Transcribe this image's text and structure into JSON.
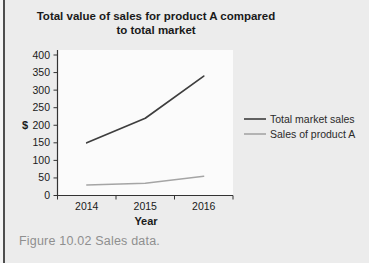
{
  "page": {
    "background_color": "#ECECEC",
    "plot_background_color": "#FBFBFB",
    "left_bar_color": "#4E4E4E"
  },
  "header": {
    "title_line1": "Total value of sales for product A compared",
    "title_line2": "to total market"
  },
  "figure": {
    "caption": "Figure 10.02 Sales data."
  },
  "chart_data": {
    "type": "line",
    "title": "Total value of sales for product A compared to total market",
    "categories": [
      "2014",
      "2015",
      "2016"
    ],
    "series": [
      {
        "name": "Total market sales",
        "values": [
          150,
          220,
          340
        ],
        "color": "#3E3E3E"
      },
      {
        "name": "Sales of product A",
        "values": [
          30,
          35,
          55
        ],
        "color": "#A5A5A5"
      }
    ],
    "xlabel": "Year",
    "ylabel": "$",
    "ylim": [
      0,
      400
    ],
    "ytick_step": 50,
    "grid": false,
    "legend_position": "right",
    "axis_color": "#333333"
  }
}
